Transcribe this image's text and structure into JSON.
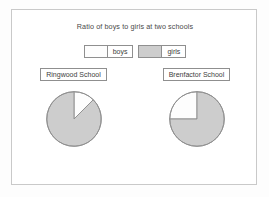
{
  "chart_data": {
    "type": "pie",
    "title": "Ratio of boys to girls at two schools",
    "xlabel": "",
    "ylabel": "",
    "grid": false,
    "legend_position": "top-center",
    "legend": [
      {
        "name": "boys",
        "color": "#fdfdfd",
        "swatch_name": "legend-swatch-boys"
      },
      {
        "name": "girls",
        "color": "#cdcdcd",
        "swatch_name": "legend-swatch-girls"
      }
    ],
    "charts": [
      {
        "label": "Ringwood School",
        "categories": [
          "boys",
          "girls"
        ],
        "values": [
          12.5,
          87.5
        ],
        "ratio": "1:7",
        "slices": [
          {
            "name": "boys",
            "start_angle": 0,
            "sweep_angle": 45,
            "color": "#fdfdfd"
          },
          {
            "name": "girls",
            "start_angle": 45,
            "sweep_angle": 315,
            "color": "#cdcdcd"
          }
        ]
      },
      {
        "label": "Brenfactor School",
        "categories": [
          "boys",
          "girls"
        ],
        "values": [
          25,
          75
        ],
        "ratio": "1:3",
        "slices": [
          {
            "name": "boys",
            "start_angle": 270,
            "sweep_angle": 90,
            "color": "#fdfdfd"
          },
          {
            "name": "girls",
            "start_angle": 0,
            "sweep_angle": 270,
            "color": "#cdcdcd"
          }
        ]
      }
    ]
  },
  "style": {
    "stroke": "#8f8f8f",
    "title_color": "#4a4a4a",
    "frame_color": "#c9c9c9",
    "background": "#ffffff"
  }
}
